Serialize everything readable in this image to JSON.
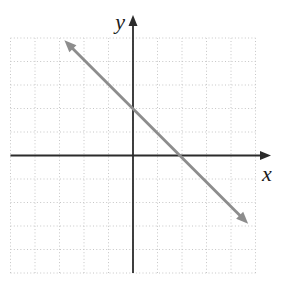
{
  "figure": {
    "background": "#ffffff",
    "axis_color": "#2b2b2b",
    "grid_color": "#c6c6c6",
    "line_color": "#8d8d8d"
  },
  "chart_data": {
    "type": "line",
    "title": "",
    "xlabel": "x",
    "ylabel": "y",
    "xlim": [
      -5,
      5
    ],
    "ylim": [
      -5,
      5
    ],
    "grid": "dotted-square-grid-1-unit",
    "legend": "none",
    "axes": "centered-cross-with-arrowheads",
    "series": [
      {
        "name": "graphed-line",
        "style": "solid-gray-arrowheads-both-ends",
        "slope": -1,
        "y_intercept": 2,
        "x_intercept": 2,
        "points": [
          [
            -2.8,
            4.9
          ],
          [
            4.7,
            -2.9
          ]
        ]
      }
    ]
  }
}
